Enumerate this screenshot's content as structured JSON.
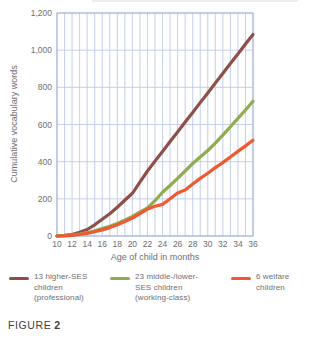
{
  "accent_colors": {
    "grid": "#bdc9ea",
    "plot_border": "#9fb1dc",
    "tick_text": "#6d6e71",
    "caption_text": "#414042"
  },
  "chart_data": {
    "type": "line",
    "title": "",
    "xlabel": "Age of child in months",
    "ylabel": "Cumulative vocabulary words",
    "xlim": [
      10,
      36
    ],
    "ylim": [
      0,
      1200
    ],
    "grid": "on",
    "legend_position": "bottom",
    "x_tick_labels": [
      "10",
      "12",
      "14",
      "16",
      "18",
      "20",
      "22",
      "24",
      "26",
      "28",
      "30",
      "32",
      "34",
      "36"
    ],
    "y_ticks": [
      {
        "value": 0,
        "label": "0"
      },
      {
        "value": 200,
        "label": "200"
      },
      {
        "value": 400,
        "label": "400"
      },
      {
        "value": 600,
        "label": "600"
      },
      {
        "value": 800,
        "label": "800"
      },
      {
        "value": 1000,
        "label": "1,000"
      },
      {
        "value": 1200,
        "label": "1,200"
      }
    ],
    "x": [
      10,
      11,
      12,
      13,
      14,
      15,
      16,
      17,
      18,
      19,
      20,
      21,
      22,
      23,
      24,
      25,
      26,
      27,
      28,
      29,
      30,
      31,
      32,
      33,
      34,
      35,
      36
    ],
    "series": [
      {
        "name": "13 higher-SES children (professional)",
        "color": "#8e4f47",
        "values": [
          0,
          3,
          8,
          20,
          35,
          60,
          90,
          120,
          155,
          192,
          230,
          290,
          350,
          403,
          455,
          508,
          560,
          613,
          665,
          718,
          770,
          823,
          875,
          928,
          980,
          1033,
          1085
        ]
      },
      {
        "name": "23 middle-/lower-SES children (working-class)",
        "color": "#8fac4e",
        "values": [
          0,
          2,
          5,
          11,
          18,
          28,
          40,
          53,
          68,
          85,
          105,
          128,
          152,
          190,
          235,
          272,
          310,
          350,
          390,
          425,
          460,
          500,
          543,
          588,
          633,
          678,
          725
        ]
      },
      {
        "name": "6 welfare children",
        "color": "#f05a31",
        "values": [
          0,
          1,
          4,
          8,
          14,
          23,
          33,
          45,
          60,
          78,
          97,
          120,
          145,
          160,
          170,
          200,
          232,
          248,
          280,
          310,
          338,
          368,
          395,
          425,
          455,
          485,
          515
        ]
      }
    ]
  },
  "legend": {
    "items": [
      {
        "color": "#8e4f47",
        "lines": [
          "13 higher-SES",
          "children",
          "(professional)"
        ]
      },
      {
        "color": "#8fac4e",
        "lines": [
          "23 middle-/lower-",
          "SES children",
          "(working-class)"
        ]
      },
      {
        "color": "#f05a31",
        "lines": [
          "6 welfare",
          "children"
        ]
      }
    ]
  },
  "caption": {
    "prefix": "FIGURE",
    "number": "2"
  }
}
